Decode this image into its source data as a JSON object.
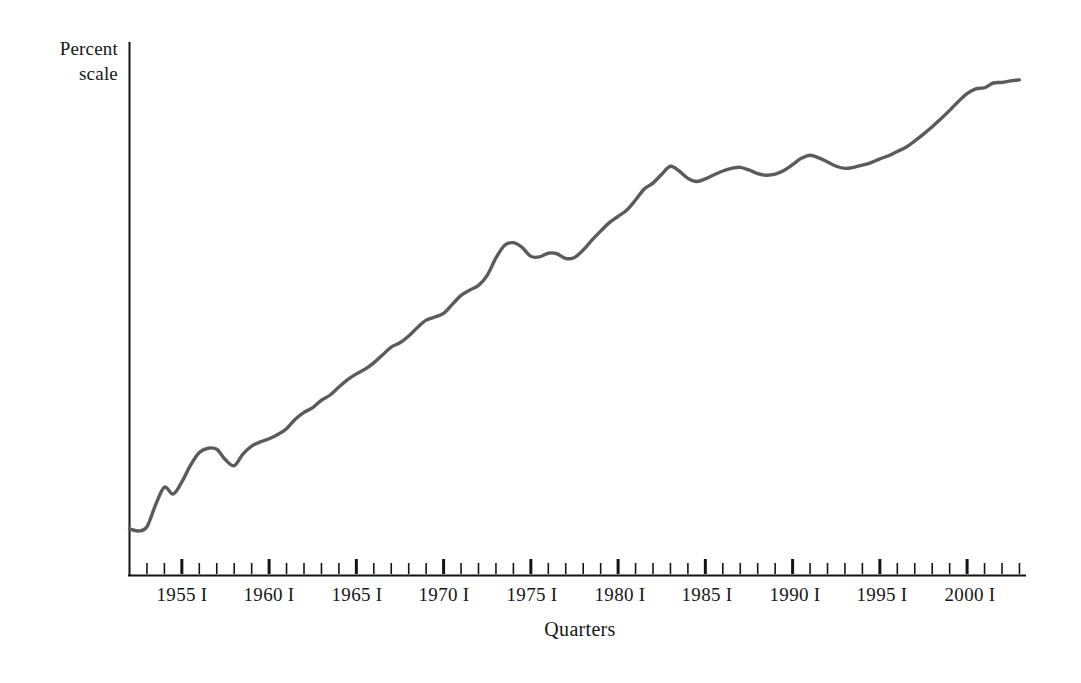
{
  "chart_data": {
    "type": "line",
    "title": "",
    "subtitle": "",
    "xlabel": "Quarters",
    "ylabel": "Percent scale",
    "grid": false,
    "legend": null,
    "annotations": [],
    "axis": {
      "y_axis_label_lines": [
        "Percent",
        "scale"
      ],
      "y_ticks_shown": false,
      "y_tick_labels": [],
      "x_tick_labels": [
        "1955 I",
        "1960 I",
        "1965 I",
        "1970 I",
        "1975 I",
        "1980 I",
        "1985 I",
        "1990 I",
        "1995 I",
        "2000 I"
      ],
      "x_minor_tick_interval": "1 year",
      "x_major_tick_interval": "5 years",
      "x_range_years": [
        1952,
        2003
      ],
      "note": "Vertical axis is a logarithmic (percent/ratio) scale with no numeric tick labels shown."
    },
    "series": [
      {
        "name": "series-1",
        "color": "#5b5b5b",
        "x": [
          1952.0,
          1952.5,
          1953.0,
          1953.5,
          1954.0,
          1954.5,
          1955.0,
          1955.5,
          1956.0,
          1956.5,
          1957.0,
          1957.5,
          1958.0,
          1958.5,
          1959.0,
          1959.5,
          1960.0,
          1960.5,
          1961.0,
          1961.5,
          1962.0,
          1962.5,
          1963.0,
          1963.5,
          1964.0,
          1964.5,
          1965.0,
          1965.5,
          1966.0,
          1966.5,
          1967.0,
          1967.5,
          1968.0,
          1968.5,
          1969.0,
          1969.5,
          1970.0,
          1970.5,
          1971.0,
          1971.5,
          1972.0,
          1972.5,
          1973.0,
          1973.5,
          1974.0,
          1974.5,
          1975.0,
          1975.5,
          1976.0,
          1976.5,
          1977.0,
          1977.5,
          1978.0,
          1978.5,
          1979.0,
          1979.5,
          1980.0,
          1980.5,
          1981.0,
          1981.5,
          1982.0,
          1982.5,
          1983.0,
          1983.5,
          1984.0,
          1984.5,
          1985.0,
          1985.5,
          1986.0,
          1986.5,
          1987.0,
          1987.5,
          1988.0,
          1988.5,
          1989.0,
          1989.5,
          1990.0,
          1990.5,
          1991.0,
          1991.5,
          1992.0,
          1992.5,
          1993.0,
          1993.5,
          1994.0,
          1994.5,
          1995.0,
          1995.5,
          1996.0,
          1996.5,
          1997.0,
          1997.5,
          1998.0,
          1998.5,
          1999.0,
          1999.5,
          2000.0,
          2000.5,
          2001.0,
          2001.5,
          2002.0,
          2002.5,
          2003.0
        ],
        "y": [
          8.0,
          7.6,
          8.4,
          12.6,
          15.9,
          14.6,
          16.9,
          20.1,
          22.5,
          23.3,
          23.1,
          21.1,
          20.0,
          22.2,
          23.7,
          24.5,
          25.1,
          25.9,
          27.0,
          28.8,
          30.1,
          31.0,
          32.4,
          33.4,
          34.9,
          36.3,
          37.4,
          38.3,
          39.5,
          41.0,
          42.5,
          43.3,
          44.6,
          46.2,
          47.6,
          48.2,
          48.9,
          50.6,
          52.3,
          53.3,
          54.2,
          56.1,
          59.4,
          61.8,
          62.3,
          61.4,
          59.7,
          59.6,
          60.3,
          60.2,
          59.3,
          59.5,
          60.9,
          62.8,
          64.5,
          66.1,
          67.3,
          68.5,
          70.4,
          72.5,
          73.6,
          75.3,
          76.8,
          75.9,
          74.5,
          73.9,
          74.4,
          75.2,
          75.9,
          76.4,
          76.6,
          76.1,
          75.4,
          75.1,
          75.3,
          76.0,
          77.1,
          78.3,
          78.9,
          78.4,
          77.6,
          76.8,
          76.4,
          76.6,
          77.0,
          77.5,
          78.2,
          78.8,
          79.6,
          80.4,
          81.6,
          82.9,
          84.3,
          85.8,
          87.4,
          89.1,
          90.6,
          91.5,
          91.7,
          92.6,
          92.7,
          93.0,
          93.2
        ]
      }
    ]
  },
  "figure": {
    "ylabel_line1": "Percent",
    "ylabel_line2": "scale",
    "xlabel": "Quarters"
  },
  "x_tick_labels": [
    {
      "label": "1955 I",
      "x": 182
    },
    {
      "label": "1960 I",
      "x": 269
    },
    {
      "label": "1965 I",
      "x": 357
    },
    {
      "label": "1970 I",
      "x": 444
    },
    {
      "label": "1975 I",
      "x": 532
    },
    {
      "label": "1980 I",
      "x": 620
    },
    {
      "label": "1985 I",
      "x": 707
    },
    {
      "label": "1990 I",
      "x": 795
    },
    {
      "label": "1995 I",
      "x": 882
    },
    {
      "label": "2000 I",
      "x": 970
    }
  ],
  "colors": {
    "line": "#5b5b5b",
    "axis": "#141414",
    "background": "#ffffff",
    "text": "#161616"
  }
}
